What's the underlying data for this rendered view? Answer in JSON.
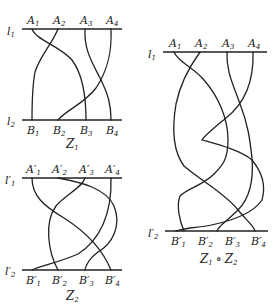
{
  "diagrams": [
    {
      "id": "Z1",
      "caption": "Z",
      "caption_sub": "1",
      "top_line": {
        "label": "l",
        "sub": "1"
      },
      "bottom_line": {
        "label": "l",
        "sub": "2"
      },
      "top_points": [
        {
          "label": "A",
          "sub": "1"
        },
        {
          "label": "A",
          "sub": "2"
        },
        {
          "label": "A",
          "sub": "3"
        },
        {
          "label": "A",
          "sub": "4"
        }
      ],
      "bottom_points": [
        {
          "label": "B",
          "sub": "1"
        },
        {
          "label": "B",
          "sub": "2"
        },
        {
          "label": "B",
          "sub": "3"
        },
        {
          "label": "B",
          "sub": "4"
        }
      ]
    },
    {
      "id": "Z2",
      "caption": "Z",
      "caption_sub": "2",
      "top_line": {
        "label": "l′",
        "sub": "1"
      },
      "bottom_line": {
        "label": "l′",
        "sub": "2"
      },
      "top_points": [
        {
          "label": "A′",
          "sub": "1"
        },
        {
          "label": "A′",
          "sub": "2"
        },
        {
          "label": "A′",
          "sub": "3"
        },
        {
          "label": "A′",
          "sub": "4"
        }
      ],
      "bottom_points": [
        {
          "label": "B′",
          "sub": "1"
        },
        {
          "label": "B′",
          "sub": "2"
        },
        {
          "label": "B′",
          "sub": "3"
        },
        {
          "label": "B′",
          "sub": "4"
        }
      ]
    },
    {
      "id": "Z1oZ2",
      "caption": "Z",
      "caption_sub": "1",
      "caption_op": "∘",
      "caption2": "Z",
      "caption2_sub": "2",
      "top_line": {
        "label": "l",
        "sub": "1"
      },
      "bottom_line": {
        "label": "l′",
        "sub": "2"
      },
      "top_points": [
        {
          "label": "A",
          "sub": "1"
        },
        {
          "label": "A",
          "sub": "2"
        },
        {
          "label": "A",
          "sub": "3"
        },
        {
          "label": "A",
          "sub": "4"
        }
      ],
      "bottom_points": [
        {
          "label": "B′",
          "sub": "1"
        },
        {
          "label": "B′",
          "sub": "2"
        },
        {
          "label": "B′",
          "sub": "3"
        },
        {
          "label": "B′",
          "sub": "4"
        }
      ]
    }
  ]
}
